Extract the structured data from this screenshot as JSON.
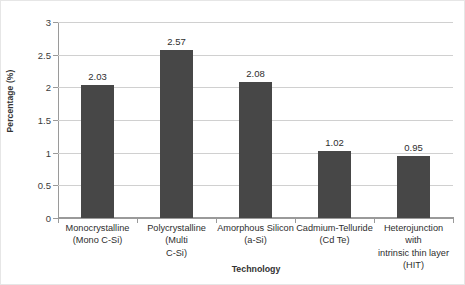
{
  "chart_data": {
    "type": "bar",
    "title": "",
    "xlabel": "Technology",
    "ylabel": "Percentage (%)",
    "categories": [
      "Monocrystalline (Mono C-Si)",
      "Polycrystalline (Multi C-Si)",
      "Amorphous Silicon (a-Si)",
      "Cadmium-Telluride (Cd Te)",
      "Heterojunction with intrinsic thin layer (HIT)"
    ],
    "category_lines": [
      [
        "Monocrystalline",
        "(Mono C-Si)"
      ],
      [
        "Polycrystalline (Multi",
        "C-Si)"
      ],
      [
        "Amorphous Silicon",
        "(a-Si)"
      ],
      [
        "Cadmium-Telluride",
        "(Cd Te)"
      ],
      [
        "Heterojunction with",
        "intrinsic thin layer",
        "(HIT)"
      ]
    ],
    "values": [
      2.03,
      2.57,
      2.08,
      1.02,
      0.95
    ],
    "value_labels": [
      "2.03",
      "2.57",
      "2.08",
      "1.02",
      "0.95"
    ],
    "ylim": [
      0,
      3
    ],
    "ytick_labels": [
      "0",
      "0.5",
      "1",
      "1.5",
      "2",
      "2.5",
      "3"
    ],
    "ytick_values": [
      0,
      0.5,
      1,
      1.5,
      2,
      2.5,
      3
    ],
    "grid": true,
    "legend": false,
    "bar_color": "#474747",
    "gridline_color": "#d0d0d0",
    "axis_color": "#9a9a9a"
  }
}
